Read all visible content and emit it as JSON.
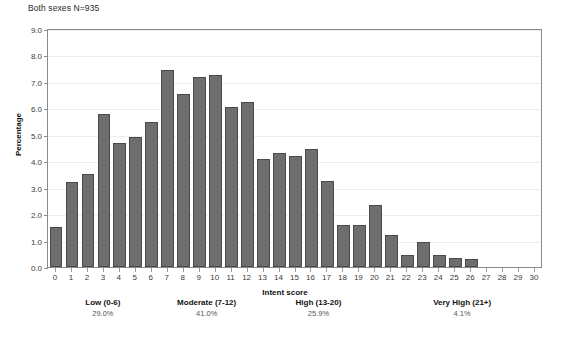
{
  "chart_data": {
    "type": "bar",
    "title": "Both sexes N=935",
    "xlabel": "Intent score",
    "ylabel": "Percentage",
    "ylim": [
      0,
      9
    ],
    "xlim": [
      0,
      30
    ],
    "grid": true,
    "legend": "none",
    "ytick_labels": [
      "0.0",
      "1.0",
      "2.0",
      "3.0",
      "4.0",
      "5.0",
      "6.0",
      "7.0",
      "8.0",
      "9.0"
    ],
    "ytick_values": [
      0,
      1,
      2,
      3,
      4,
      5,
      6,
      7,
      8,
      9
    ],
    "categories": [
      "0",
      "1",
      "2",
      "3",
      "4",
      "5",
      "6",
      "7",
      "8",
      "9",
      "10",
      "11",
      "12",
      "13",
      "14",
      "15",
      "16",
      "17",
      "18",
      "19",
      "20",
      "21",
      "22",
      "23",
      "24",
      "25",
      "26",
      "27",
      "28",
      "29",
      "30"
    ],
    "values": [
      1.5,
      3.2,
      3.5,
      5.8,
      4.7,
      4.9,
      5.5,
      7.45,
      6.55,
      7.2,
      7.25,
      6.05,
      6.25,
      4.1,
      4.3,
      4.2,
      4.45,
      3.25,
      1.6,
      1.6,
      2.35,
      1.2,
      0.45,
      0.95,
      0.45,
      0.35,
      0.3,
      0.0,
      0.0,
      0.0,
      0.0
    ],
    "annotations": [
      {
        "label": "Low (0-6)",
        "percent": "29.0%",
        "range_start": 0,
        "range_end": 6
      },
      {
        "label": "Moderate (7-12)",
        "percent": "41.0%",
        "range_start": 7,
        "range_end": 12
      },
      {
        "label": "High (13-20)",
        "percent": "25.9%",
        "range_start": 13,
        "range_end": 20
      },
      {
        "label": "Very High (21+)",
        "percent": "4.1%",
        "range_start": 21,
        "range_end": 30
      }
    ],
    "colors": {
      "bar_fill": "#6e6e6e",
      "bar_edge": "#4a4a4a",
      "axis": "#8a8a8a",
      "grid": "#ededed",
      "text": "#1a1a1a"
    }
  }
}
